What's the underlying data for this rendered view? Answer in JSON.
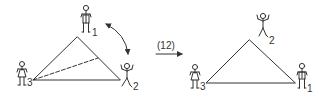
{
  "diagram": {
    "before": {
      "figures": [
        {
          "id": "person-1",
          "label": "1",
          "position": "top",
          "type": "man"
        },
        {
          "id": "person-2",
          "label": "2",
          "position": "right",
          "type": "man-arms-raised"
        },
        {
          "id": "person-3",
          "label": "3",
          "position": "left",
          "type": "woman"
        }
      ],
      "swap_arrow": "double-headed curved arrow between person 1 and person 2",
      "dashed_line": "from left vertex to right edge of triangle"
    },
    "transition": {
      "label": "(12)",
      "arrow": "right-arrow"
    },
    "after": {
      "figures": [
        {
          "id": "person-2",
          "label": "2",
          "position": "top",
          "type": "man-arms-raised"
        },
        {
          "id": "person-1",
          "label": "1",
          "position": "right",
          "type": "man"
        },
        {
          "id": "person-3",
          "label": "3",
          "position": "left",
          "type": "woman"
        }
      ]
    }
  },
  "colors": {
    "stroke": "#333333",
    "background": "#ffffff"
  }
}
